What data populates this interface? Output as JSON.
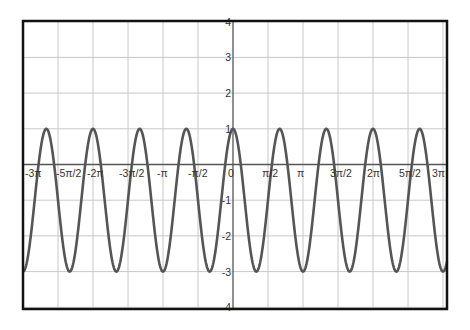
{
  "chart_data": {
    "type": "line",
    "title": "",
    "xlabel": "",
    "ylabel": "",
    "function": "y = 2cos(3x) - 1",
    "xlim_pi_units": [
      -3,
      3
    ],
    "ylim": [
      -4.2,
      4.2
    ],
    "grid": true,
    "x_ticks": [
      {
        "value": -3.0,
        "label": "-3π"
      },
      {
        "value": -2.5,
        "label": "-5π/2"
      },
      {
        "value": -2.0,
        "label": "-2π"
      },
      {
        "value": -1.5,
        "label": "-3π/2"
      },
      {
        "value": -1.0,
        "label": "-π"
      },
      {
        "value": -0.5,
        "label": "-π/2"
      },
      {
        "value": 0.0,
        "label": "0"
      },
      {
        "value": 0.5,
        "label": "π/2"
      },
      {
        "value": 1.0,
        "label": "π"
      },
      {
        "value": 1.5,
        "label": "3π/2"
      },
      {
        "value": 2.0,
        "label": "2π"
      },
      {
        "value": 2.5,
        "label": "5π/2"
      },
      {
        "value": 3.0,
        "label": "3π"
      }
    ],
    "y_ticks": [
      {
        "value": 4,
        "label": "4"
      },
      {
        "value": 3,
        "label": "3"
      },
      {
        "value": 2,
        "label": "2"
      },
      {
        "value": 1,
        "label": "1"
      },
      {
        "value": -1,
        "label": "-1"
      },
      {
        "value": -2,
        "label": "-2"
      },
      {
        "value": -3,
        "label": "-3"
      },
      {
        "value": -4,
        "label": "-4"
      }
    ],
    "series": [
      {
        "name": "y = 2cos(3x) - 1",
        "color": "#555555",
        "amplitude": 2,
        "frequency": 3,
        "vertical_shift": -1,
        "max": 1,
        "min": -3,
        "period_pi_units": 0.6667
      }
    ]
  },
  "colors": {
    "frame": "#111111",
    "grid": "#c8c8c8",
    "axis": "#555555",
    "curve": "#555555",
    "tick_text": "#333333"
  }
}
